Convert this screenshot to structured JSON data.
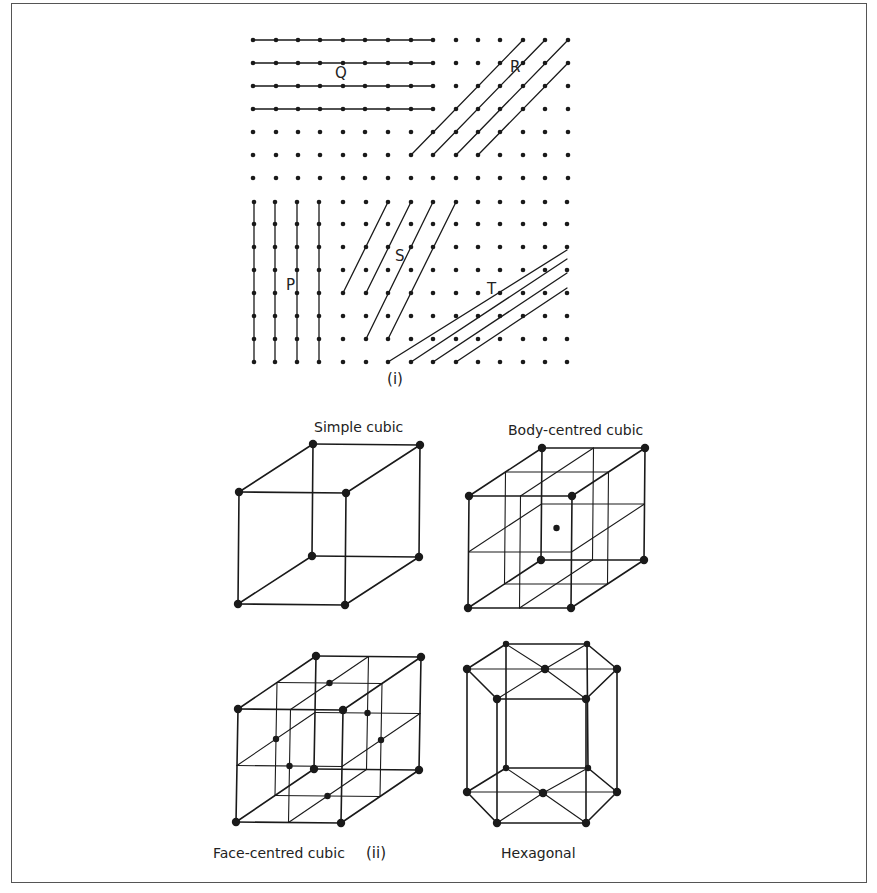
{
  "figure": {
    "panel_i": {
      "label": "(i)",
      "label_pos": [
        395,
        384
      ],
      "grid": {
        "top_cols_x": [
          253,
          276,
          298,
          320,
          343,
          365,
          388,
          411,
          433,
          456,
          478,
          500,
          523,
          545,
          568
        ],
        "top_rows_y": [
          40,
          63,
          86,
          109,
          132,
          155,
          178
        ],
        "bottom_cols_x": [
          254,
          275,
          297,
          319,
          343,
          366,
          388,
          411,
          433,
          456,
          478,
          500,
          523,
          545,
          567
        ],
        "bottom_rows_y": [
          202,
          224,
          247,
          270,
          293,
          316,
          339,
          362
        ],
        "dot_radius": 2.3,
        "color": "#1a1a1a"
      },
      "families": [
        {
          "name": "Q",
          "label_pos": [
            335,
            78
          ],
          "lines": [
            [
              253,
              40,
              433,
              40
            ],
            [
              253,
              63,
              433,
              63
            ],
            [
              253,
              86,
              433,
              86
            ],
            [
              253,
              109,
              433,
              109
            ]
          ]
        },
        {
          "name": "R",
          "label_pos": [
            510,
            72
          ],
          "lines": [
            [
              411,
              155,
              523,
              40
            ],
            [
              433,
              155,
              545,
              40
            ],
            [
              456,
              155,
              568,
              40
            ],
            [
              478,
              155,
              568,
              63
            ]
          ]
        },
        {
          "name": "P",
          "label_pos": [
            286,
            290
          ],
          "lines": [
            [
              254,
              202,
              254,
              362
            ],
            [
              275,
              202,
              275,
              362
            ],
            [
              297,
              202,
              297,
              362
            ],
            [
              319,
              202,
              319,
              362
            ]
          ]
        },
        {
          "name": "S",
          "label_pos": [
            395,
            261
          ],
          "lines": [
            [
              388,
              202,
              343,
              293
            ],
            [
              411,
              202,
              366,
              293
            ],
            [
              433,
              202,
              366,
              339
            ],
            [
              456,
              202,
              388,
              339
            ]
          ]
        },
        {
          "name": "T",
          "label_pos": [
            487,
            294
          ],
          "lines": [
            [
              388,
              362,
              567,
              250
            ],
            [
              411,
              362,
              567,
              259
            ],
            [
              433,
              362,
              567,
              273
            ],
            [
              456,
              362,
              567,
              288
            ]
          ]
        }
      ]
    },
    "panel_ii": {
      "label": "(ii)",
      "label_pos": [
        366,
        858
      ],
      "structures": [
        {
          "name": "Simple cubic",
          "type": "sc",
          "label_pos": [
            314,
            432
          ],
          "origin": [
            239,
            492
          ],
          "u": [
            107,
            1
          ],
          "v": [
            -1,
            112
          ],
          "w": [
            74,
            -48
          ]
        },
        {
          "name": "Body-centred cubic",
          "type": "bcc",
          "label_pos": [
            508,
            435
          ],
          "origin": [
            469,
            496
          ],
          "u": [
            103,
            0
          ],
          "v": [
            -1,
            112
          ],
          "w": [
            73,
            -48
          ]
        },
        {
          "name": "Face-centred cubic",
          "type": "fcc",
          "label_pos": [
            213,
            858
          ],
          "origin": [
            238,
            709
          ],
          "u": [
            105,
            1
          ],
          "v": [
            -2,
            113
          ],
          "w": [
            78,
            -53
          ]
        },
        {
          "name": "Hexagonal",
          "type": "hcp",
          "label_pos": [
            501,
            858
          ],
          "top": {
            "back_left": [
              506,
              644
            ],
            "back_right": [
              587,
              644
            ],
            "left": [
              467,
              669
            ],
            "right": [
              617,
              669
            ],
            "front_left": [
              497,
              699
            ],
            "front_right": [
              586,
              699
            ],
            "center": [
              545,
              669
            ]
          },
          "bottom": {
            "back_left": [
              506,
              768
            ],
            "back_right": [
              588,
              768
            ],
            "left": [
              467,
              792
            ],
            "right": [
              617,
              792
            ],
            "front_left": [
              497,
              823
            ],
            "front_right": [
              586,
              823
            ],
            "center": [
              543,
              793
            ]
          }
        }
      ]
    },
    "style": {
      "line_color": "#1a1a1a",
      "atom_radius": 4.2,
      "center_atom_radius": 3.2
    }
  }
}
